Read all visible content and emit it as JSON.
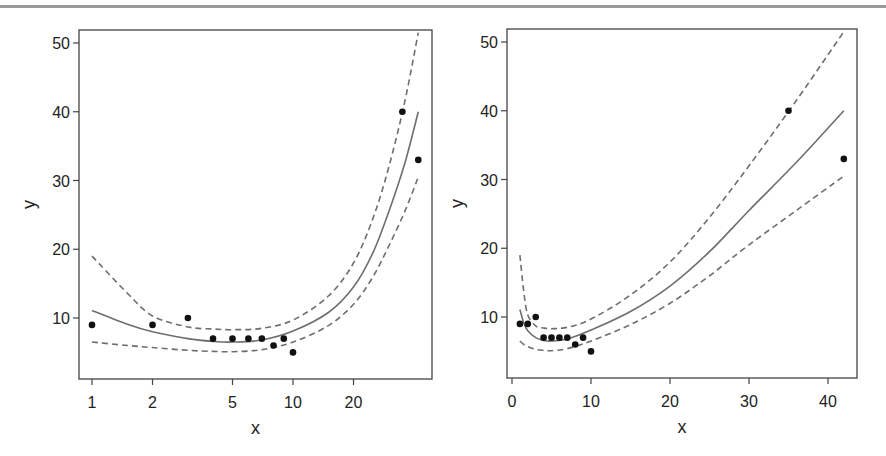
{
  "chart_data": [
    {
      "type": "scatter",
      "panel": "left",
      "title": "",
      "xlabel": "x",
      "ylabel": "y",
      "xscale": "log",
      "xticks": [
        1,
        2,
        5,
        10,
        20
      ],
      "yticks": [
        10,
        20,
        30,
        40,
        50
      ],
      "xlim": [
        0.86,
        52
      ],
      "ylim": [
        1,
        52
      ],
      "grid": false,
      "legend": "none",
      "points": {
        "x": [
          1,
          2,
          3,
          4,
          5,
          6,
          7,
          8,
          9,
          10,
          35,
          42
        ],
        "y": [
          9,
          9,
          10,
          7,
          7,
          7,
          7,
          6,
          7,
          5,
          40,
          33
        ]
      },
      "series": [
        {
          "name": "fit",
          "style": "solid",
          "x": [
            1,
            1.5,
            2,
            3,
            4,
            5,
            7,
            10,
            15,
            20,
            25,
            30,
            36,
            42
          ],
          "y": [
            11.1,
            9.1,
            8.0,
            7.0,
            6.6,
            6.5,
            6.8,
            8.1,
            10.8,
            14.5,
            19.5,
            25.5,
            32.5,
            40
          ]
        },
        {
          "name": "upper",
          "style": "dashed",
          "x": [
            1,
            1.5,
            2,
            3,
            4,
            5,
            7,
            10,
            15,
            20,
            25,
            30,
            36,
            42
          ],
          "y": [
            19,
            13.6,
            10.3,
            8.7,
            8.4,
            8.3,
            8.5,
            9.7,
            13.2,
            18,
            24.5,
            32,
            41.5,
            51.5
          ]
        },
        {
          "name": "lower",
          "style": "dashed",
          "x": [
            1,
            1.5,
            2,
            3,
            4,
            5,
            7,
            10,
            15,
            20,
            25,
            30,
            36,
            42
          ],
          "y": [
            6.5,
            6.0,
            5.7,
            5.3,
            5.15,
            5.1,
            5.4,
            6.5,
            8.9,
            12,
            16,
            20.5,
            25.5,
            30.5
          ]
        }
      ]
    },
    {
      "type": "scatter",
      "panel": "right",
      "title": "",
      "xlabel": "x",
      "ylabel": "y",
      "xscale": "linear",
      "xticks": [
        0,
        10,
        20,
        30,
        40
      ],
      "yticks": [
        10,
        20,
        30,
        40,
        50
      ],
      "xlim": [
        -0.6,
        43.5
      ],
      "ylim": [
        1,
        52
      ],
      "grid": false,
      "legend": "none",
      "points": {
        "x": [
          1,
          2,
          3,
          4,
          5,
          6,
          7,
          8,
          9,
          10,
          35,
          42
        ],
        "y": [
          9,
          9,
          10,
          7,
          7,
          7,
          7,
          6,
          7,
          5,
          40,
          33
        ]
      },
      "series": [
        {
          "name": "fit",
          "style": "solid",
          "x": [
            1,
            1.5,
            2,
            3,
            4,
            5,
            7,
            10,
            15,
            20,
            25,
            30,
            36,
            42
          ],
          "y": [
            11.1,
            9.1,
            8.0,
            7.0,
            6.6,
            6.5,
            6.8,
            8.1,
            10.8,
            14.5,
            19.5,
            25.5,
            32.5,
            40
          ]
        },
        {
          "name": "upper",
          "style": "dashed",
          "x": [
            1,
            1.5,
            2,
            3,
            4,
            5,
            7,
            10,
            15,
            20,
            25,
            30,
            36,
            42
          ],
          "y": [
            19,
            13.6,
            10.3,
            8.7,
            8.4,
            8.3,
            8.5,
            9.7,
            13.2,
            18,
            24.5,
            32,
            41.5,
            51.5
          ]
        },
        {
          "name": "lower",
          "style": "dashed",
          "x": [
            1,
            1.5,
            2,
            3,
            4,
            5,
            7,
            10,
            15,
            20,
            25,
            30,
            36,
            42
          ],
          "y": [
            6.5,
            6.0,
            5.7,
            5.3,
            5.15,
            5.1,
            5.4,
            6.5,
            8.9,
            12,
            16,
            20.5,
            25.5,
            30.5
          ]
        }
      ]
    }
  ],
  "layout": {
    "panels": [
      {
        "box": [
          79,
          30,
          432,
          379
        ],
        "xpx": [
          92,
          293
        ],
        "xscale": "log",
        "ypx": [
          318,
          43
        ],
        "yval": [
          10,
          50
        ]
      },
      {
        "box": [
          507,
          29,
          857,
          378
        ],
        "xpx": [
          512,
          828
        ],
        "xval": [
          0,
          40
        ],
        "xscale": "linear",
        "ypx": [
          317,
          42
        ],
        "yval": [
          10,
          50
        ]
      }
    ],
    "colors": {
      "line": "#6e6e6e",
      "point": "#111111",
      "axis": "#444444",
      "text": "#222222"
    }
  }
}
